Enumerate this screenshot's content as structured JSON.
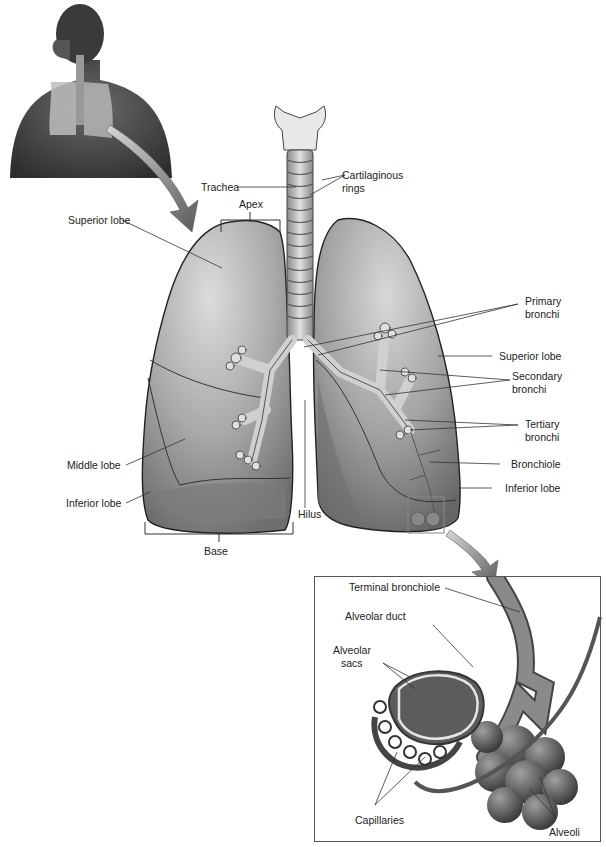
{
  "figure": {
    "style": "grayscale anatomical illustration"
  },
  "labels": {
    "trachea": "Trachea",
    "cartilaginous_rings": [
      "Cartilaginous",
      "rings"
    ],
    "apex": "Apex",
    "superior_lobe_right": "Superior lobe",
    "middle_lobe": "Middle lobe",
    "inferior_lobe_right": "Inferior lobe",
    "base": "Base",
    "hilus": "Hilus",
    "primary_bronchi": [
      "Primary",
      "bronchi"
    ],
    "superior_lobe_left": "Superior lobe",
    "secondary_bronchi": [
      "Secondary",
      "bronchi"
    ],
    "tertiary_bronchi": [
      "Tertiary",
      "bronchi"
    ],
    "bronchiole": "Bronchiole",
    "inferior_lobe_left": "Inferior lobe"
  },
  "inset": {
    "terminal_bronchiole": "Terminal bronchiole",
    "alveolar_duct": "Alveolar duct",
    "alveolar_sacs": [
      "Alveolar",
      "sacs"
    ],
    "capillaries": "Capillaries",
    "alveoli": "Alveoli"
  },
  "colors": {
    "lung_fill": "#8f8f8f",
    "lung_light": "#c9c9c9",
    "outline": "#2a2a2a",
    "leader_line": "#333333",
    "arrow": "#7a7a7a",
    "background": "#ffffff"
  }
}
